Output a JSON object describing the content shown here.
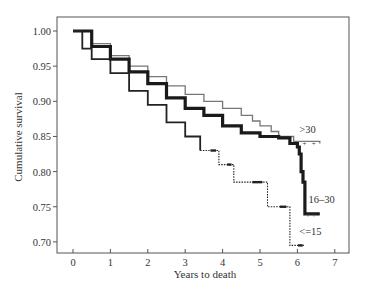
{
  "chart_data": {
    "type": "line",
    "subtype": "kaplan-meier step",
    "title": "",
    "xlabel": "Years to death",
    "ylabel": "Cumulative survival",
    "xlim": [
      -0.45,
      7.35
    ],
    "ylim": [
      0.685,
      1.02
    ],
    "x_ticks": [
      0,
      1,
      2,
      3,
      4,
      5,
      6,
      7
    ],
    "x_tick_labels": [
      "0",
      "1",
      "2",
      "3",
      "4",
      "5",
      "6",
      "7"
    ],
    "y_ticks": [
      1.0,
      0.95,
      0.9,
      0.85,
      0.8,
      0.75,
      0.7
    ],
    "y_tick_labels": [
      "1.00",
      "0.95",
      "0.90",
      "0.85",
      "0.80",
      "0.75",
      "0.70"
    ],
    "grid": false,
    "legend": "inline labels at curve ends",
    "series": [
      {
        "name": ">30",
        "label": ">30",
        "color": "#777777",
        "style": "thin gray",
        "points": [
          [
            0,
            1.0
          ],
          [
            0.5,
            0.982
          ],
          [
            1,
            0.965
          ],
          [
            1.5,
            0.95
          ],
          [
            2,
            0.935
          ],
          [
            2.5,
            0.922
          ],
          [
            3,
            0.91
          ],
          [
            3.5,
            0.9
          ],
          [
            4,
            0.89
          ],
          [
            4.5,
            0.88
          ],
          [
            4.8,
            0.872
          ],
          [
            5,
            0.865
          ],
          [
            5.3,
            0.857
          ],
          [
            5.5,
            0.85
          ],
          [
            5.9,
            0.85
          ],
          [
            5.9,
            0.843
          ],
          [
            6.6,
            0.84
          ]
        ],
        "label_pos": [
          6.05,
          0.855
        ]
      },
      {
        "name": "16-30",
        "label": "16–30",
        "color": "#1a1a1a",
        "style": "thick black",
        "points": [
          [
            0,
            1.0
          ],
          [
            0.5,
            0.978
          ],
          [
            1,
            0.96
          ],
          [
            1.5,
            0.942
          ],
          [
            2,
            0.925
          ],
          [
            2.5,
            0.905
          ],
          [
            3,
            0.89
          ],
          [
            3.5,
            0.88
          ],
          [
            4,
            0.865
          ],
          [
            4.5,
            0.855
          ],
          [
            5,
            0.85
          ],
          [
            5.5,
            0.848
          ],
          [
            5.8,
            0.84
          ],
          [
            6.0,
            0.835
          ],
          [
            6.05,
            0.825
          ],
          [
            6.1,
            0.8
          ],
          [
            6.15,
            0.785
          ],
          [
            6.2,
            0.785
          ],
          [
            6.2,
            0.74
          ],
          [
            6.6,
            0.74
          ]
        ],
        "label_pos": [
          6.3,
          0.755
        ]
      },
      {
        "name": "<=15",
        "label": "<=15",
        "color": "#222222",
        "style": "thin dark, dotted tail",
        "points": [
          [
            0,
            1.0
          ],
          [
            0.25,
            0.975
          ],
          [
            0.5,
            0.96
          ],
          [
            1,
            0.94
          ],
          [
            1.5,
            0.915
          ],
          [
            2,
            0.895
          ],
          [
            2.5,
            0.87
          ],
          [
            3,
            0.85
          ],
          [
            3.4,
            0.83
          ],
          [
            3.9,
            0.83
          ],
          [
            3.9,
            0.81
          ],
          [
            4.3,
            0.81
          ],
          [
            4.3,
            0.785
          ],
          [
            5.2,
            0.785
          ],
          [
            5.2,
            0.75
          ],
          [
            5.8,
            0.75
          ],
          [
            5.8,
            0.695
          ],
          [
            6.2,
            0.695
          ]
        ],
        "label_pos": [
          6.05,
          0.71
        ]
      }
    ]
  }
}
